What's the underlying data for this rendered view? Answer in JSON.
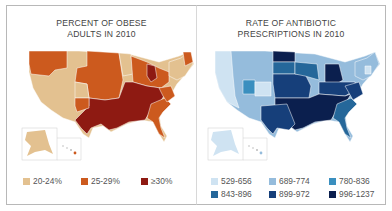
{
  "left_map": {
    "title_line1": "PERCENT OF OBESE",
    "title_line2": "ADULTS IN 2010",
    "legend": [
      {
        "label": "20-24%",
        "color": "#e3c190"
      },
      {
        "label": "25-29%",
        "color": "#cc5a1e"
      },
      {
        "label": "≥30%",
        "color": "#8e1a12"
      }
    ]
  },
  "right_map": {
    "title_line1": "RATE OF ANTIBIOTIC",
    "title_line2": "PRESCRIPTIONS IN 2010",
    "legend": [
      {
        "label": "529-656",
        "color": "#cfe3f2"
      },
      {
        "label": "689-774",
        "color": "#95bcdc"
      },
      {
        "label": "780-836",
        "color": "#3a8fbf"
      },
      {
        "label": "843-896",
        "color": "#25679a"
      },
      {
        "label": "899-972",
        "color": "#163f7a"
      },
      {
        "label": "996-1237",
        "color": "#0b1f4e"
      }
    ]
  }
}
